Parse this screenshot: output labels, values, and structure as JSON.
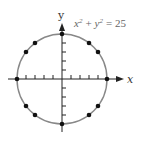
{
  "diagram": {
    "equation": {
      "lhs_x": "x",
      "exp": "2",
      "plus": "+",
      "lhs_y": "y",
      "equals": "= 25"
    },
    "x_axis_label": "x",
    "y_axis_label": "y",
    "circle": {
      "radius": 5,
      "center": [
        0,
        0
      ],
      "color": "#888888"
    },
    "axis_color": "#222222",
    "point_color": "#111111",
    "lattice_points": [
      [
        5,
        0
      ],
      [
        4,
        3
      ],
      [
        3,
        4
      ],
      [
        0,
        5
      ],
      [
        -3,
        4
      ],
      [
        -4,
        3
      ],
      [
        -5,
        0
      ],
      [
        -4,
        -3
      ],
      [
        -3,
        -4
      ],
      [
        0,
        -5
      ],
      [
        3,
        -4
      ],
      [
        4,
        -3
      ]
    ],
    "ticks": [
      -4,
      -3,
      -2,
      -1,
      1,
      2,
      3,
      4
    ]
  }
}
